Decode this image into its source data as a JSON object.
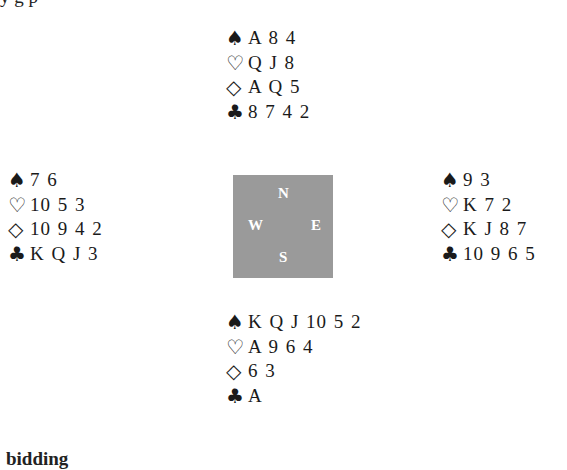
{
  "top_cut_text": "y g p",
  "bottom_cut_text": "bidding",
  "suit_icons": {
    "spades": "♠",
    "hearts": "♡",
    "diamonds": "◇",
    "clubs": "♣"
  },
  "compass": {
    "N": "N",
    "S": "S",
    "W": "W",
    "E": "E",
    "color": "#9a9a9a"
  },
  "hands": {
    "north": {
      "spades": "A 8 4",
      "hearts": "Q J 8",
      "diamonds": "A Q 5",
      "clubs": "8 7 4 2"
    },
    "west": {
      "spades": "7 6",
      "hearts": "10 5 3",
      "diamonds": "10 9 4 2",
      "clubs": "K Q J 3"
    },
    "east": {
      "spades": "9 3",
      "hearts": "K 7 2",
      "diamonds": "K J 8 7",
      "clubs": "10 9 6 5"
    },
    "south": {
      "spades": "K Q J 10 5 2",
      "hearts": "A 9 6 4",
      "diamonds": "6 3",
      "clubs": "A"
    }
  }
}
